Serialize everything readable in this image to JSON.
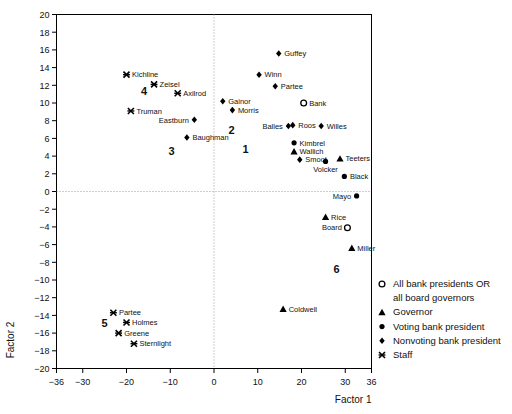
{
  "chart_data": {
    "type": "scatter",
    "title": "",
    "xlabel": "Factor 1",
    "ylabel": "Factor 2",
    "xlim": [
      -36,
      36
    ],
    "ylim": [
      -20,
      20
    ],
    "xticks": [
      -36,
      -30,
      -20,
      -10,
      0,
      10,
      20,
      30,
      36
    ],
    "xticklabels": [
      "−36",
      "−30",
      "−20",
      "−10",
      "0",
      "10",
      "20",
      "30",
      "36"
    ],
    "yticks": [
      -20,
      -18,
      -16,
      -14,
      -12,
      -10,
      -8,
      -6,
      -4,
      -2,
      0,
      2,
      4,
      6,
      8,
      10,
      12,
      14,
      16,
      18,
      20
    ],
    "yticklabels": [
      "−20",
      "−18",
      "−16",
      "−14",
      "−12",
      "−10",
      "−8",
      "−6",
      "−4",
      "−2",
      "0",
      "2",
      "4",
      "6",
      "8",
      "10",
      "12",
      "14",
      "16",
      "18",
      "20"
    ],
    "grid": false,
    "zero_lines": true,
    "legend_position": "bottom-right-outside",
    "marker_types": {
      "open-circle": "All bank presidents OR all board governors",
      "triangle": "Governor",
      "circle": "Voting bank president",
      "diamond": "Nonvoting bank president",
      "cross": "Staff"
    },
    "points": [
      {
        "label": "Kichline",
        "x": -20.0,
        "y": 13.2,
        "marker": "cross",
        "label_side": "right"
      },
      {
        "label": "Zeisel",
        "x": -13.7,
        "y": 12.1,
        "marker": "cross",
        "label_side": "right"
      },
      {
        "label": "Axilrod",
        "x": -8.3,
        "y": 11.1,
        "marker": "cross",
        "label_side": "right"
      },
      {
        "label": "Truman",
        "x": -19.0,
        "y": 9.1,
        "marker": "cross",
        "label_side": "right"
      },
      {
        "label": "Eastburn",
        "x": -4.5,
        "y": 8.1,
        "marker": "diamond",
        "label_side": "left"
      },
      {
        "label": "Baughman",
        "x": -6.2,
        "y": 6.1,
        "marker": "diamond",
        "label_side": "right"
      },
      {
        "label": "Gainor",
        "x": 2.0,
        "y": 10.2,
        "marker": "diamond",
        "label_side": "right"
      },
      {
        "label": "Morris",
        "x": 4.2,
        "y": 9.2,
        "marker": "diamond",
        "label_side": "right"
      },
      {
        "label": "Guffey",
        "x": 14.8,
        "y": 15.6,
        "marker": "diamond",
        "label_side": "right"
      },
      {
        "label": "Winn",
        "x": 10.3,
        "y": 13.2,
        "marker": "diamond",
        "label_side": "right"
      },
      {
        "label": "Partee",
        "x": 14.0,
        "y": 11.9,
        "marker": "diamond",
        "label_side": "right"
      },
      {
        "label": "Bank",
        "x": 20.5,
        "y": 10.0,
        "marker": "open-circle",
        "label_side": "right"
      },
      {
        "label": "Balles",
        "x": 17.0,
        "y": 7.4,
        "marker": "diamond",
        "label_side": "left"
      },
      {
        "label": "Roos",
        "x": 18.0,
        "y": 7.5,
        "marker": "diamond",
        "label_side": "right"
      },
      {
        "label": "Willes",
        "x": 24.5,
        "y": 7.4,
        "marker": "diamond",
        "label_side": "right"
      },
      {
        "label": "Kimbrel",
        "x": 18.3,
        "y": 5.5,
        "marker": "circle",
        "label_side": "right"
      },
      {
        "label": "Wallich",
        "x": 18.3,
        "y": 4.5,
        "marker": "triangle",
        "label_side": "right"
      },
      {
        "label": "Smoot",
        "x": 19.6,
        "y": 3.6,
        "marker": "diamond",
        "label_side": "right"
      },
      {
        "label": "Teeters",
        "x": 28.8,
        "y": 3.7,
        "marker": "triangle",
        "label_side": "right"
      },
      {
        "label": "Volcker",
        "x": 25.5,
        "y": 3.4,
        "marker": "circle",
        "label_side": "below"
      },
      {
        "label": "Black",
        "x": 29.8,
        "y": 1.7,
        "marker": "circle",
        "label_side": "right"
      },
      {
        "label": "Mayo",
        "x": 32.6,
        "y": -0.5,
        "marker": "circle",
        "label_side": "left"
      },
      {
        "label": "Rice",
        "x": 25.5,
        "y": -2.9,
        "marker": "triangle",
        "label_side": "right"
      },
      {
        "label": "Board",
        "x": 30.5,
        "y": -4.1,
        "marker": "open-circle",
        "label_side": "left"
      },
      {
        "label": "Miller",
        "x": 31.5,
        "y": -6.4,
        "marker": "triangle",
        "label_side": "right"
      },
      {
        "label": "Coldwell",
        "x": 15.8,
        "y": -13.3,
        "marker": "triangle",
        "label_side": "right"
      },
      {
        "label": "Partee",
        "x": -23.0,
        "y": -13.7,
        "marker": "cross",
        "label_side": "right"
      },
      {
        "label": "Holmes",
        "x": -20.0,
        "y": -14.8,
        "marker": "cross",
        "label_side": "right"
      },
      {
        "label": "Greene",
        "x": -21.8,
        "y": -16.0,
        "marker": "cross",
        "label_side": "right"
      },
      {
        "label": "Sternlight",
        "x": -18.3,
        "y": -17.2,
        "marker": "cross",
        "label_side": "right"
      }
    ],
    "cluster_labels": [
      {
        "text": "4",
        "x": -16.0,
        "y": 11.3
      },
      {
        "text": "3",
        "x": -9.7,
        "y": 4.6
      },
      {
        "text": "2",
        "x": 4.0,
        "y": 6.9
      },
      {
        "text": "1",
        "x": 7.2,
        "y": 4.8
      },
      {
        "text": "6",
        "x": 28.0,
        "y": -8.8
      },
      {
        "text": "5",
        "x": -25.0,
        "y": -14.9
      }
    ]
  },
  "legend": {
    "items": [
      {
        "marker": "open-circle",
        "line1": "All bank presidents OR",
        "line2": "all board governors"
      },
      {
        "marker": "triangle",
        "line1": "Governor",
        "line2": ""
      },
      {
        "marker": "circle",
        "line1": "Voting bank president",
        "line2": ""
      },
      {
        "marker": "diamond",
        "line1": "Nonvoting bank president",
        "line2": ""
      },
      {
        "marker": "cross",
        "line1": "Staff",
        "line2": ""
      }
    ]
  }
}
